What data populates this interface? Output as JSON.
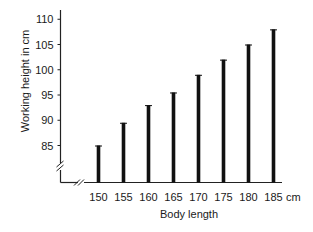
{
  "chart_data": {
    "type": "bar",
    "title": "",
    "xlabel": "Body length",
    "ylabel": "Working height in cm",
    "x_unit": "cm",
    "categories": [
      "150",
      "155",
      "160",
      "165",
      "170",
      "175",
      "180",
      "185"
    ],
    "values": [
      85,
      89.5,
      93,
      95.5,
      99,
      102,
      105,
      108
    ],
    "yticks": [
      85,
      90,
      95,
      100,
      105,
      110
    ],
    "ylim": [
      80,
      112
    ],
    "grid": false,
    "legend": null,
    "axis_breaks": {
      "x": true,
      "y": true
    },
    "bar_color": "#111111"
  }
}
